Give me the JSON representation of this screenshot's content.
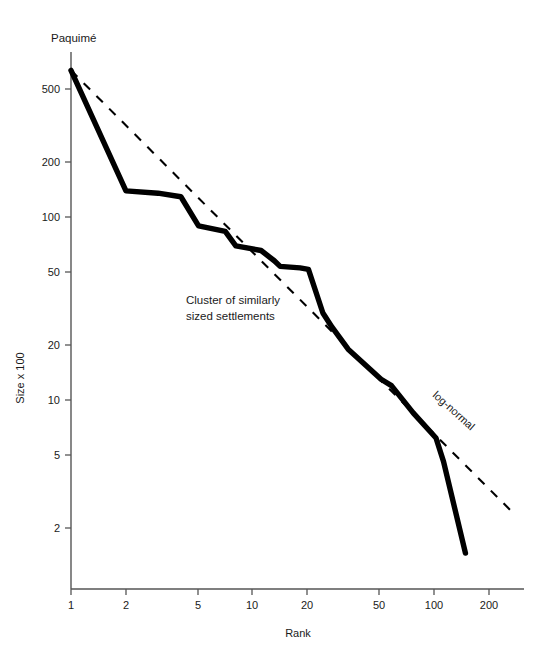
{
  "chart_data": {
    "type": "line",
    "title": "",
    "subtitle": "",
    "xlabel": "Rank",
    "ylabel": "Size x 100",
    "xscale": "log",
    "yscale": "log",
    "xlim": [
      1,
      260
    ],
    "ylim": [
      1.25,
      800
    ],
    "grid": false,
    "legend_position": "inline-annotation",
    "xticks": [
      1,
      2,
      5,
      10,
      20,
      50,
      100,
      200
    ],
    "xtick_labels": [
      "1",
      "2",
      "5",
      "10",
      "20",
      "50",
      "100",
      "200"
    ],
    "yticks": [
      2,
      5,
      10,
      20,
      50,
      100,
      200,
      500
    ],
    "ytick_labels": [
      "2",
      "5",
      "10",
      "20",
      "50",
      "100",
      "200",
      "500"
    ],
    "series": [
      {
        "name": "rank-size-curve",
        "style": "solid-thick",
        "color": "#000000",
        "x": [
          1,
          2,
          3,
          4,
          5,
          7,
          8,
          11,
          13,
          14,
          18,
          20,
          24,
          27,
          33,
          50,
          57,
          75,
          100,
          110,
          145
        ],
        "values": [
          640,
          140,
          136,
          130,
          90,
          84,
          70,
          66,
          58,
          54,
          53,
          52,
          30,
          25,
          19,
          13,
          12,
          8.5,
          6.2,
          4.6,
          1.45
        ]
      },
      {
        "name": "log-normal",
        "style": "dashed",
        "color": "#000000",
        "x": [
          1,
          260
        ],
        "values": [
          640,
          2.45
        ]
      }
    ],
    "annotations": [
      {
        "name": "paquime-point-label",
        "text": "Paquimé",
        "x": 1,
        "y": 640,
        "placement": "above-left"
      },
      {
        "name": "cluster-note",
        "text": "Cluster of similarly\nsized settlements",
        "line1": "Cluster of similarly",
        "line2": "sized settlements",
        "x": 9,
        "y": 32
      },
      {
        "name": "log-normal-label",
        "text": "log-normal",
        "x": 90,
        "y": 11,
        "rotation": 42
      }
    ],
    "colors": {
      "axis": "#4d4d4d",
      "curve": "#000000",
      "reference_line": "#000000",
      "text": "#1a1a1a",
      "background": "#ffffff"
    }
  }
}
